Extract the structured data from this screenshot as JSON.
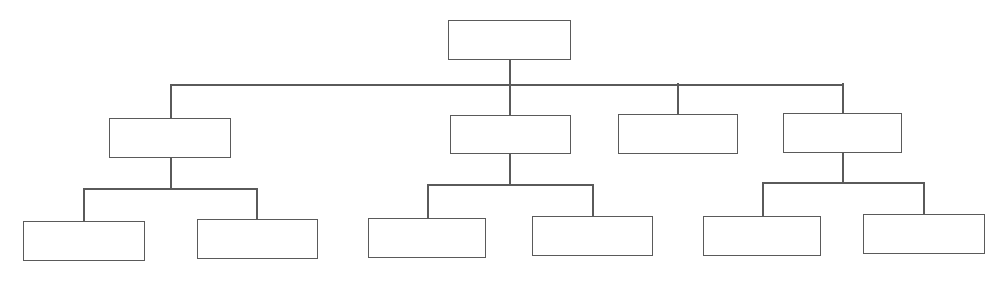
{
  "diagram": {
    "type": "org-chart / tree",
    "line_color": "#5a5a5a",
    "background": "#ffffff",
    "nodes": [
      {
        "id": "root",
        "label": "",
        "x": 448,
        "y": 20,
        "w": 123,
        "h": 40
      },
      {
        "id": "l2-a",
        "label": "",
        "x": 109,
        "y": 118,
        "w": 122,
        "h": 40,
        "parent": "root"
      },
      {
        "id": "l2-b",
        "label": "",
        "x": 450,
        "y": 115,
        "w": 121,
        "h": 39,
        "parent": "root"
      },
      {
        "id": "l2-c",
        "label": "",
        "x": 618,
        "y": 114,
        "w": 120,
        "h": 40,
        "parent": "root"
      },
      {
        "id": "l2-d",
        "label": "",
        "x": 783,
        "y": 113,
        "w": 119,
        "h": 40,
        "parent": "root"
      },
      {
        "id": "l3-a1",
        "label": "",
        "x": 23,
        "y": 221,
        "w": 122,
        "h": 40,
        "parent": "l2-a"
      },
      {
        "id": "l3-a2",
        "label": "",
        "x": 197,
        "y": 219,
        "w": 121,
        "h": 40,
        "parent": "l2-a"
      },
      {
        "id": "l3-b1",
        "label": "",
        "x": 368,
        "y": 218,
        "w": 118,
        "h": 40,
        "parent": "l2-b"
      },
      {
        "id": "l3-b2",
        "label": "",
        "x": 532,
        "y": 216,
        "w": 121,
        "h": 40,
        "parent": "l2-b"
      },
      {
        "id": "l3-d1",
        "label": "",
        "x": 703,
        "y": 216,
        "w": 118,
        "h": 40,
        "parent": "l2-d"
      },
      {
        "id": "l3-d2",
        "label": "",
        "x": 863,
        "y": 214,
        "w": 122,
        "h": 40,
        "parent": "l2-d"
      }
    ],
    "connectors": [
      {
        "id": "root-down",
        "x": 509,
        "y": 60,
        "w": 2,
        "h": 25
      },
      {
        "id": "l1-bus",
        "x": 170,
        "y": 84,
        "w": 674,
        "h": 2
      },
      {
        "id": "to-a",
        "x": 170,
        "y": 84,
        "w": 2,
        "h": 34
      },
      {
        "id": "to-b",
        "x": 509,
        "y": 84,
        "w": 2,
        "h": 31
      },
      {
        "id": "to-c",
        "x": 677,
        "y": 83,
        "w": 2,
        "h": 31
      },
      {
        "id": "to-d",
        "x": 842,
        "y": 83,
        "w": 2,
        "h": 30
      },
      {
        "id": "a-down",
        "x": 170,
        "y": 158,
        "w": 2,
        "h": 31
      },
      {
        "id": "a-bus",
        "x": 83,
        "y": 188,
        "w": 175,
        "h": 2
      },
      {
        "id": "a-to-1",
        "x": 83,
        "y": 188,
        "w": 2,
        "h": 33
      },
      {
        "id": "a-to-2",
        "x": 256,
        "y": 188,
        "w": 2,
        "h": 31
      },
      {
        "id": "b-down",
        "x": 509,
        "y": 154,
        "w": 2,
        "h": 31
      },
      {
        "id": "b-bus",
        "x": 427,
        "y": 184,
        "w": 167,
        "h": 2
      },
      {
        "id": "b-to-1",
        "x": 427,
        "y": 184,
        "w": 2,
        "h": 34
      },
      {
        "id": "b-to-2",
        "x": 592,
        "y": 184,
        "w": 2,
        "h": 32
      },
      {
        "id": "d-down",
        "x": 842,
        "y": 153,
        "w": 2,
        "h": 30
      },
      {
        "id": "d-bus",
        "x": 762,
        "y": 182,
        "w": 163,
        "h": 2
      },
      {
        "id": "d-to-1",
        "x": 762,
        "y": 182,
        "w": 2,
        "h": 34
      },
      {
        "id": "d-to-2",
        "x": 923,
        "y": 182,
        "w": 2,
        "h": 32
      }
    ]
  }
}
